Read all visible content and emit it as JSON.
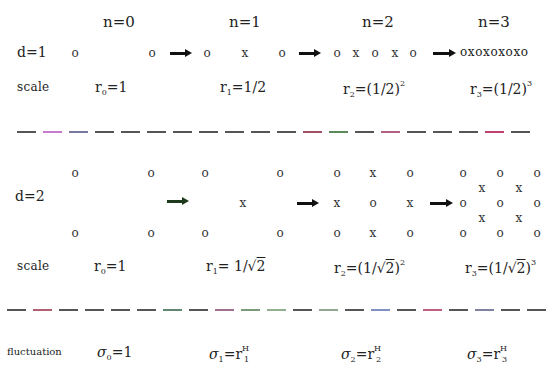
{
  "headers": [
    "n=0",
    "n=1",
    "n=2",
    "n=3"
  ],
  "d1": {
    "label": "d=1",
    "n0": [
      "o",
      "o"
    ],
    "n1": [
      "o",
      "x",
      "o"
    ],
    "n2": [
      "o",
      "x",
      "o",
      "x",
      "o"
    ],
    "n3": "oxoxoxoxo"
  },
  "scale1": {
    "label": "scale",
    "r0": {
      "base": "r",
      "sub": "0",
      "rhs": "=1"
    },
    "r1": {
      "base": "r",
      "sub": "1",
      "rhs": "=1/2"
    },
    "r2": {
      "base": "r",
      "sub": "2",
      "rhs": "=(1/2)",
      "exp": "2"
    },
    "r3": {
      "base": "r",
      "sub": "3",
      "rhs": "=(1/2)",
      "exp": "3"
    }
  },
  "d2": {
    "label": "d=2",
    "n0": [
      [
        "o",
        "o"
      ],
      [
        "o",
        "o"
      ]
    ],
    "n1": {
      "corners": [
        "o",
        "o",
        "o",
        "o"
      ],
      "center": "x"
    },
    "n2": [
      [
        "o",
        "x",
        "o"
      ],
      [
        "x",
        "o",
        "x"
      ],
      [
        "o",
        "x",
        "o"
      ]
    ],
    "n3": [
      [
        "o",
        "o",
        "o"
      ],
      [
        "x",
        "x"
      ],
      [
        "o",
        "o",
        "o"
      ],
      [
        "x",
        "x"
      ],
      [
        "o",
        "o",
        "o"
      ]
    ]
  },
  "scale2": {
    "label": "scale",
    "r0": {
      "base": "r",
      "sub": "0",
      "rhs": "=1"
    },
    "r1": {
      "base": "r",
      "sub": "1",
      "rhs_pre": "= 1/",
      "rad": "2"
    },
    "r2": {
      "base": "r",
      "sub": "2",
      "rhs_pre": "=(1/",
      "rad": "2",
      "rhs_post": ")",
      "exp": "2"
    },
    "r3": {
      "base": "r",
      "sub": "3",
      "rhs_pre": "=(1/",
      "rad": "2",
      "rhs_post": ")",
      "exp": "3"
    }
  },
  "fluctuation": {
    "label": "fluctuation",
    "s0": {
      "base": "σ",
      "sub": "0",
      "rhs": "=1"
    },
    "s1": {
      "base": "σ",
      "sub": "1",
      "rhs": "=r",
      "rsub": "1",
      "rsup": "H"
    },
    "s2": {
      "base": "σ",
      "sub": "2",
      "rhs": "=r",
      "rsub": "2",
      "rsup": "H"
    },
    "s3": {
      "base": "σ",
      "sub": "3",
      "rhs": "=r",
      "rsub": "3",
      "rsup": "H"
    }
  },
  "colors": {
    "arrow": "#111111",
    "arrow_d2_first": "#1d3a1d",
    "dashes": "#555555"
  }
}
